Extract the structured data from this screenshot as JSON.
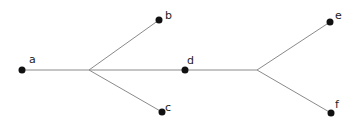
{
  "diagram": {
    "type": "tree",
    "colors": {
      "edge": "#8a8a8a",
      "node": "#111111",
      "label": "#222222"
    },
    "nodes": {
      "a": {
        "label": "a",
        "x": 22,
        "y": 70
      },
      "b": {
        "label": "b",
        "x": 159,
        "y": 20
      },
      "c": {
        "label": "c",
        "x": 162,
        "y": 112
      },
      "d": {
        "label": "d",
        "x": 185,
        "y": 70
      },
      "e": {
        "label": "e",
        "x": 330,
        "y": 22
      },
      "f": {
        "label": "f",
        "x": 331,
        "y": 113
      }
    },
    "junctions": [
      {
        "id": "j1",
        "x": 89,
        "y": 70
      },
      {
        "id": "j2",
        "x": 257,
        "y": 70
      }
    ],
    "edges": [
      [
        "a",
        "j1"
      ],
      [
        "j1",
        "b"
      ],
      [
        "j1",
        "c"
      ],
      [
        "j1",
        "d"
      ],
      [
        "d",
        "j2"
      ],
      [
        "j2",
        "e"
      ],
      [
        "j2",
        "f"
      ]
    ]
  }
}
